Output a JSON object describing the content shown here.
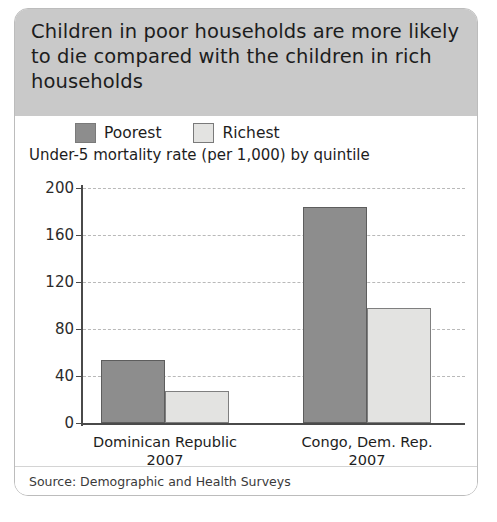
{
  "card": {
    "title": "Children in poor households are more likely to die compared with the children in rich households",
    "source": "Source: Demographic and Health Surveys"
  },
  "chart_data": {
    "type": "bar",
    "title": "Children in poor households are more likely to die compared with the children in rich households",
    "subtitle": "Under-5 mortality rate (per 1,000) by quintile",
    "xlabel": "",
    "ylabel": "",
    "ylim": [
      0,
      200
    ],
    "yticks": [
      0,
      40,
      80,
      120,
      160,
      200
    ],
    "grid": true,
    "legend_position": "top-left",
    "categories": [
      "Dominican Republic\n2007",
      "Congo, Dem. Rep.\n2007"
    ],
    "category_lines": [
      [
        "Dominican Republic",
        "2007"
      ],
      [
        "Congo, Dem. Rep.",
        "2007"
      ]
    ],
    "series": [
      {
        "name": "Poorest",
        "color": "#8d8d8d",
        "values": [
          54,
          184
        ]
      },
      {
        "name": "Richest",
        "color": "#e3e3e1",
        "values": [
          27,
          98
        ]
      }
    ],
    "source": "Source: Demographic and Health Surveys"
  },
  "colors": {
    "header_band": "#c9c9c9",
    "poorest": "#8d8d8d",
    "richest": "#e3e3e1",
    "axis": "#4a4a4a",
    "gridline": "#b9b9b9",
    "card_border": "#bcbcbc"
  }
}
